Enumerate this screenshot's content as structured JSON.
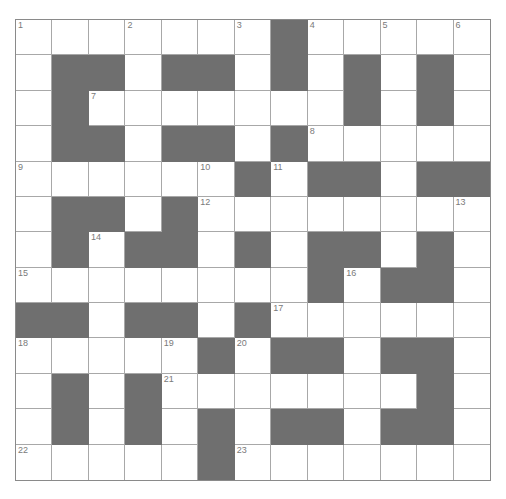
{
  "puzzle": {
    "rows": 13,
    "cols": 13,
    "colors": {
      "block": "#6f6f6f",
      "white": "#ffffff",
      "gridline": "#a8a8a8",
      "number": "#7a7a7a"
    },
    "layout": [
      "WWWWWWWBWWWWW",
      "WBBWBBWBWBWBW",
      "WBWWWWWWWBWBW",
      "WBBWBBWBWWWWW",
      "WWWWWWBWBBWBB",
      "WBBWBWWWWWWWW",
      "WBWBBWBWBBWBW",
      "WWWWWWWWBWBBW",
      "BBWBBWBWWWWWW",
      "WWWWWBWBBWBBW",
      "WBWBWWWWWWWBW",
      "WBWBWBWBBWBBW",
      "WWWWWBWWWWWWW"
    ],
    "numbers": [
      {
        "n": "1",
        "r": 0,
        "c": 0
      },
      {
        "n": "2",
        "r": 0,
        "c": 3
      },
      {
        "n": "3",
        "r": 0,
        "c": 6
      },
      {
        "n": "4",
        "r": 0,
        "c": 8
      },
      {
        "n": "5",
        "r": 0,
        "c": 10
      },
      {
        "n": "6",
        "r": 0,
        "c": 12
      },
      {
        "n": "7",
        "r": 2,
        "c": 2
      },
      {
        "n": "8",
        "r": 3,
        "c": 8
      },
      {
        "n": "9",
        "r": 4,
        "c": 0
      },
      {
        "n": "10",
        "r": 4,
        "c": 5
      },
      {
        "n": "11",
        "r": 4,
        "c": 7
      },
      {
        "n": "12",
        "r": 5,
        "c": 5
      },
      {
        "n": "13",
        "r": 5,
        "c": 12
      },
      {
        "n": "14",
        "r": 6,
        "c": 2
      },
      {
        "n": "15",
        "r": 7,
        "c": 0
      },
      {
        "n": "16",
        "r": 7,
        "c": 9
      },
      {
        "n": "17",
        "r": 8,
        "c": 7
      },
      {
        "n": "18",
        "r": 9,
        "c": 0
      },
      {
        "n": "19",
        "r": 9,
        "c": 4
      },
      {
        "n": "20",
        "r": 9,
        "c": 6
      },
      {
        "n": "21",
        "r": 10,
        "c": 4
      },
      {
        "n": "22",
        "r": 12,
        "c": 0
      },
      {
        "n": "23",
        "r": 12,
        "c": 6
      }
    ]
  }
}
